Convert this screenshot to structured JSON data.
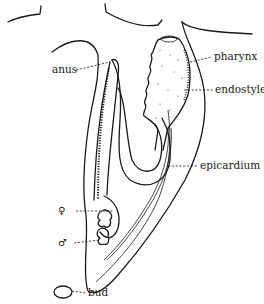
{
  "figure": {
    "labels": {
      "anus": "anus",
      "pharynx": "pharynx",
      "endostyle": "endostyle",
      "epicardium": "epicardium",
      "female": "♀",
      "male": "♂",
      "bud": "bud"
    },
    "colors": {
      "ink": "#1a1a1a",
      "background": "#ffffff"
    }
  }
}
